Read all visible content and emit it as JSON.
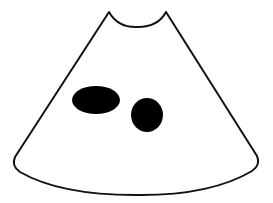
{
  "figure": {
    "background": "#ffffff",
    "outline_color": "#111111",
    "fill_color": "#ffffff",
    "spot_color": "#000000",
    "shapes": {
      "cone": {
        "label": "cone-outline"
      },
      "spot_left": {
        "label": "left-spot",
        "cx": 96,
        "cy": 100,
        "rx": 24,
        "ry": 14
      },
      "spot_right": {
        "label": "right-spot",
        "cx": 147,
        "cy": 115,
        "rx": 16,
        "ry": 17
      }
    }
  }
}
